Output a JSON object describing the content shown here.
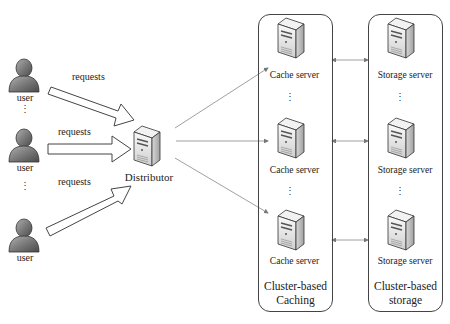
{
  "users": [
    {
      "label": "user"
    },
    {
      "label": "user"
    },
    {
      "label": "user"
    }
  ],
  "requests": [
    {
      "label": "requests"
    },
    {
      "label": "requests"
    },
    {
      "label": "requests"
    }
  ],
  "distributor": {
    "label": "Distributor"
  },
  "caching_cluster": {
    "title_line1": "Cluster-based",
    "title_line2": "Caching",
    "servers": [
      {
        "label": "Cache server"
      },
      {
        "label": "Cache server"
      },
      {
        "label": "Cache server"
      }
    ]
  },
  "storage_cluster": {
    "title_line1": "Cluster-based",
    "title_line2": "storage",
    "servers": [
      {
        "label": "Storage server"
      },
      {
        "label": "Storage server"
      },
      {
        "label": "Storage server"
      }
    ]
  },
  "ellipsis": "⋮",
  "colors": {
    "user_fill": "#7a7a7a",
    "server_front": "#e8e8e8",
    "server_side": "#b8b8b8",
    "line": "#888888",
    "border": "#444444"
  }
}
